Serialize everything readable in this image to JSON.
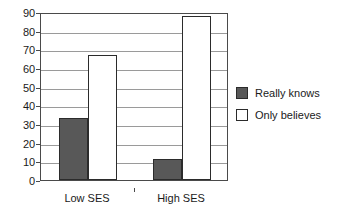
{
  "chart_data": {
    "type": "bar",
    "title": "",
    "subtitle": "",
    "xlabel": "",
    "ylabel": "",
    "ylim": [
      0,
      90
    ],
    "ytick_step": 10,
    "yticks": [
      "90",
      "80",
      "70",
      "60",
      "50",
      "40",
      "30",
      "20",
      "10",
      "0"
    ],
    "grid": true,
    "grid_orientation": "horizontal",
    "legend_position": "right",
    "categories": [
      "Low SES",
      "High SES"
    ],
    "series": [
      {
        "name": "Really knows",
        "values": [
          33,
          11
        ],
        "color": "#585858",
        "border_color": "#2b2b2b"
      },
      {
        "name": "Only believes",
        "values": [
          67,
          88
        ],
        "color": "#ffffff",
        "border_color": "#2b2b2b"
      }
    ]
  },
  "legend": {
    "items": [
      {
        "label": "Really knows",
        "swatch": "dark"
      },
      {
        "label": "Only believes",
        "swatch": "light"
      }
    ]
  },
  "colors": {
    "axis": "#4a4a4a",
    "grid": "#9a9a9a",
    "text": "#1a1a1a",
    "series_dark": "#585858",
    "series_light": "#ffffff",
    "background": "#ffffff"
  }
}
